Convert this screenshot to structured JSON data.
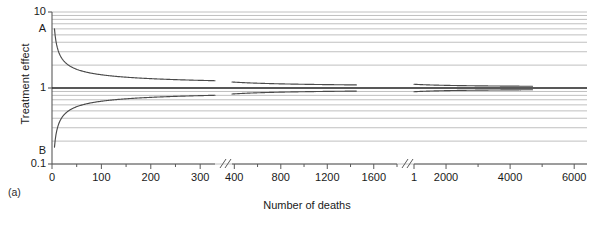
{
  "chart_data": {
    "type": "line",
    "subtype": "funnel-plot",
    "title": "",
    "panel_label": "(a)",
    "xlabel": "Number of deaths",
    "ylabel": "Treatment effect",
    "yscale": "log",
    "ylim": [
      0.1,
      10
    ],
    "ytick_labels": [
      "10",
      "A",
      "1",
      "B",
      "0.1"
    ],
    "ytick_values": [
      10,
      6.0,
      1,
      0.15,
      0.1
    ],
    "grid": true,
    "grid_style": "horizontal log minor gridlines",
    "legend": "none",
    "x_axis_broken": true,
    "x_breaks": 2,
    "xtick_labels": [
      "0",
      "100",
      "200",
      "300",
      "400",
      "800",
      "1200",
      "1600",
      "1",
      "2000",
      "4000",
      "6000"
    ],
    "xtick_values": [
      0,
      100,
      200,
      300,
      400,
      800,
      1200,
      1600,
      1000,
      2000,
      4000,
      6000
    ],
    "segments": [
      {
        "name": "segment-1",
        "x_range": [
          0,
          330
        ],
        "x_ticks": [
          0,
          100,
          200,
          300
        ],
        "upper_start": 6.0,
        "lower_start": 0.15,
        "upper_end": 1.22,
        "lower_end": 0.82
      },
      {
        "name": "segment-2",
        "x_range": [
          380,
          1450
        ],
        "x_ticks": [
          400,
          800,
          1200,
          1600
        ],
        "upper_start": 1.2,
        "lower_start": 0.84,
        "upper_end": 1.03,
        "lower_end": 0.97
      },
      {
        "name": "segment-3",
        "x_range": [
          1000,
          4700
        ],
        "x_ticks": [
          1000,
          2000,
          4000,
          6000
        ],
        "upper_start": 1.12,
        "lower_start": 0.9,
        "upper_end": 1.01,
        "lower_end": 0.99
      }
    ],
    "reference_line": {
      "name": "null-effect-line",
      "value": 1.0
    },
    "series": [
      {
        "name": "upper-funnel-bound",
        "role": "upper 95% confidence limit"
      },
      {
        "name": "lower-funnel-bound",
        "role": "lower 95% confidence limit"
      },
      {
        "name": "null-effect-reference",
        "role": "no treatment effect (ratio = 1)"
      }
    ],
    "annotations": [
      {
        "label": "A",
        "axis": "y",
        "value": 6.0,
        "meaning": "upper funnel origin"
      },
      {
        "label": "B",
        "axis": "y",
        "value": 0.15,
        "meaning": "lower funnel origin"
      }
    ]
  },
  "colors": {
    "curve": "#4a4a4a",
    "reference": "#2b2b2b",
    "grid": "#b9b9b9",
    "axis": "#5a5a5a",
    "text": "#1a1a1a"
  }
}
